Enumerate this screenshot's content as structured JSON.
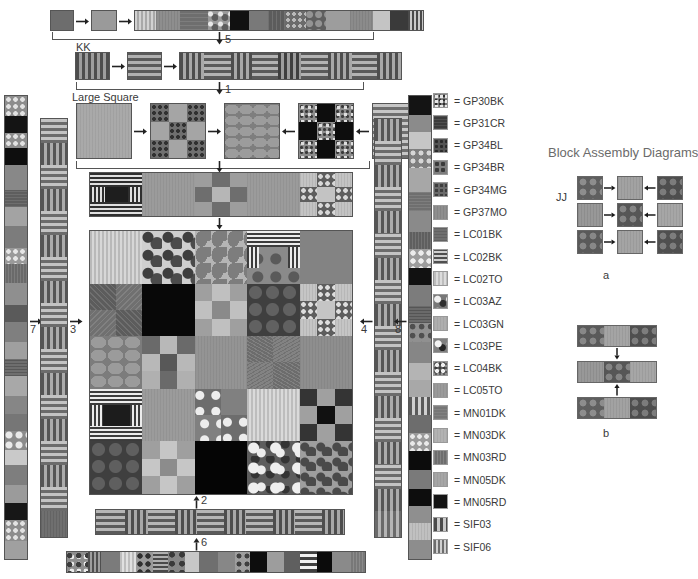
{
  "document": {
    "kind": "quilt-assembly-diagram",
    "background": "#ffffff"
  },
  "labels": {
    "kk": "KK",
    "jj": "JJ",
    "large_square": "Large Square",
    "block_assembly_title": "Block Assembly Diagrams",
    "diagram_a": "a",
    "diagram_b": "b",
    "step_1": "1",
    "step_2": "2",
    "step_3": "3",
    "step_4": "4",
    "step_5": "5",
    "step_6": "6",
    "step_7": "7",
    "step_8": "8"
  },
  "legend": {
    "title": null,
    "items": [
      {
        "code": "GP30BK",
        "swatch": "gp30bk",
        "color": "#8a8a8a"
      },
      {
        "code": "GP31CR",
        "swatch": "gp31cr",
        "color": "#3b3b3b"
      },
      {
        "code": "GP34BL",
        "swatch": "gp34bl",
        "color": "#545454"
      },
      {
        "code": "GP34BR",
        "swatch": "gp34br",
        "color": "#7d7d7d"
      },
      {
        "code": "GP34MG",
        "swatch": "gp34mg",
        "color": "#6a6a6a"
      },
      {
        "code": "GP37MO",
        "swatch": "gp37mo",
        "color": "#8e8e8e"
      },
      {
        "code": "LC01BK",
        "swatch": "lc01bk",
        "color": "#6f6f6f"
      },
      {
        "code": "LC02BK",
        "swatch": "lc02bk",
        "color": "#7a7a7a"
      },
      {
        "code": "LC02TO",
        "swatch": "lc02to",
        "color": "#bdbdbd"
      },
      {
        "code": "LC03AZ",
        "swatch": "lc03az",
        "color": "#787878"
      },
      {
        "code": "LC03GN",
        "swatch": "lc03gn",
        "color": "#aeaeae"
      },
      {
        "code": "LC03PE",
        "swatch": "lc03pe",
        "color": "#808080"
      },
      {
        "code": "LC04BK",
        "swatch": "lc04bk",
        "color": "#8f8f8f"
      },
      {
        "code": "LC05TO",
        "swatch": "lc05to",
        "color": "#9a9a9a"
      },
      {
        "code": "MN01DK",
        "swatch": "mn01dk",
        "color": "#767676"
      },
      {
        "code": "MN03DK",
        "swatch": "mn03dk",
        "color": "#b2b2b2"
      },
      {
        "code": "MN03RD",
        "swatch": "mn03rd",
        "color": "#6e6e6e"
      },
      {
        "code": "MN05DK",
        "swatch": "mn05dk",
        "color": "#a6a6a6"
      },
      {
        "code": "MN05RD",
        "swatch": "mn05rd",
        "color": "#141414"
      },
      {
        "code": "SIF03",
        "swatch": "sif03",
        "color": "#8c8c8c"
      },
      {
        "code": "SIF06",
        "swatch": "sif06",
        "color": "#9e9e9e"
      }
    ]
  },
  "chart_data": {
    "type": "table",
    "note": "Pieced-quilt construction chart: center grid of 25 blocks, four border strips, two corner strips and block assembly sub-diagrams.",
    "center_grid": {
      "rows": 5,
      "cols": 5,
      "blocks": [
        [
          "stripe-v-lt",
          "floral-dk",
          "paisley-md",
          "cross-stripe",
          "solid-md"
        ],
        [
          "check9-dk",
          "solid-black",
          "nine-patch-lt",
          "dots-dk",
          "nine-patch-md"
        ],
        [
          "circles-md",
          "nine-patch-dk",
          "solid-md",
          "texture-dk",
          "solid-md"
        ],
        [
          "cross-stripe2",
          "solid-md",
          "puzzle-md",
          "stripe-v-lt",
          "nine-patch-dk"
        ],
        [
          "dots-dk",
          "nine-patch-lt",
          "solid-black",
          "puzzle-dk",
          "paisley-dk"
        ]
      ]
    },
    "top_band": {
      "count": 5,
      "blocks": [
        "cross-stripe",
        "solid-md",
        "nine-patch-dk",
        "solid-md",
        "nine-patch-lt"
      ]
    },
    "large_square_row": {
      "count": 5,
      "blocks": [
        "solid-lt",
        "nine-patch-md",
        "circles-md",
        "checker-black",
        "stripe-h-lt"
      ]
    },
    "strip_5": {
      "orientation": "horizontal",
      "segments": 14
    },
    "strip_1": {
      "orientation": "horizontal",
      "segments": 9
    },
    "strip_2": {
      "orientation": "horizontal",
      "segments": 10
    },
    "strip_6": {
      "orientation": "horizontal",
      "segments": 15
    },
    "strip_7": {
      "orientation": "vertical",
      "segments": 24
    },
    "strip_3": {
      "orientation": "vertical",
      "segments": 18
    },
    "strip_4": {
      "orientation": "vertical",
      "segments": 18
    },
    "strip_8": {
      "orientation": "vertical",
      "segments": 24
    },
    "diagram_a": {
      "rows": 3,
      "cols": 3,
      "arrows": "inward-horizontal"
    },
    "diagram_b": {
      "rows": 3,
      "cols": 3,
      "arrows": "inward-vertical"
    }
  }
}
